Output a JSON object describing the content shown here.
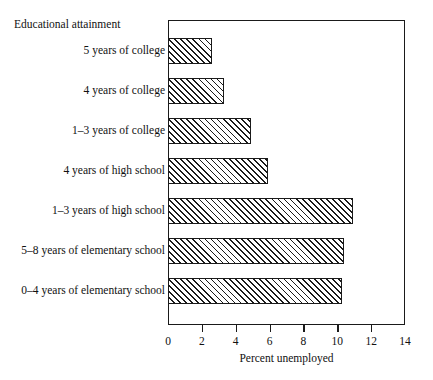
{
  "chart_data": {
    "type": "bar",
    "orientation": "horizontal",
    "title": "",
    "xlabel": "Percent unemployed",
    "ylabel": "Educational attainment",
    "xlim": [
      0,
      14
    ],
    "xticks": [
      0,
      2,
      4,
      6,
      8,
      10,
      12,
      14
    ],
    "xtick_labels": [
      "0",
      "2",
      "4",
      "6",
      "8",
      "10",
      "12",
      "14"
    ],
    "grid": false,
    "legend": null,
    "bar_style": {
      "fill": "hatched-diagonal",
      "edge_color": "#1a1a1a",
      "face_color": "#ffffff"
    },
    "categories": [
      "5 years of college",
      "4 years of college",
      "1–3 years of college",
      "4 years of high school",
      "1–3 years of high school",
      "5–8 years of elementary school",
      "0–4 years of elementary school"
    ],
    "values": [
      2.6,
      3.3,
      4.9,
      5.9,
      10.9,
      10.4,
      10.3
    ]
  }
}
